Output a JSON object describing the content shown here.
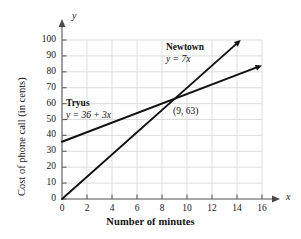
{
  "chart_data": {
    "type": "line",
    "title": "",
    "xlabel": "Number of minutes",
    "ylabel": "Cost of phone call (in cents)",
    "x_axis_symbol": "x",
    "y_axis_symbol": "y",
    "xlim": [
      0,
      16
    ],
    "ylim": [
      0,
      100
    ],
    "xticks": [
      0,
      2,
      4,
      6,
      8,
      10,
      12,
      14,
      16
    ],
    "yticks": [
      0,
      10,
      20,
      30,
      40,
      50,
      60,
      70,
      80,
      90,
      100
    ],
    "xtick_labels": [
      "0",
      "2",
      "4",
      "6",
      "8",
      "10",
      "12",
      "14",
      "16"
    ],
    "ytick_labels": [
      "0",
      "10",
      "20",
      "30",
      "40",
      "50",
      "60",
      "70",
      "80",
      "90",
      "100"
    ],
    "grid": true,
    "grid_color": "#d9d9d9",
    "axis_color": "#8a8a8a",
    "line_color": "#111111",
    "legend_position": "inline-annotations",
    "series": [
      {
        "name": "Tryus",
        "equation": "y = 36 + 3x",
        "slope": 3,
        "intercept": 36,
        "x": [
          0,
          16
        ],
        "values": [
          36,
          84
        ],
        "arrow_end": true
      },
      {
        "name": "Newtown",
        "equation": "y = 7x",
        "slope": 7,
        "intercept": 0,
        "x": [
          0,
          14.3
        ],
        "values": [
          0,
          100
        ],
        "arrow_end": true
      }
    ],
    "annotations": [
      {
        "label": "(9, 63)",
        "x": 9,
        "y": 63,
        "kind": "intersection-point"
      }
    ]
  },
  "figure": {
    "xaxis_title": "Number of minutes",
    "yaxis_title": "Cost of phone call (in cents)",
    "x_symbol": "x",
    "y_symbol": "y",
    "newtown": {
      "name": "Newtown",
      "equation": "y = 7x"
    },
    "tryus": {
      "name": "Tryus",
      "equation": "y = 36 + 3x"
    },
    "intersection_label": "(9, 63)"
  }
}
